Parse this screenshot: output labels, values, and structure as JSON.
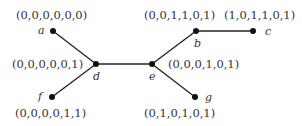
{
  "diagram": {
    "type": "tree",
    "nodes": [
      {
        "id": "a",
        "label": "a",
        "vector": "(0,0,0,0,0,0)",
        "x": 53,
        "y": 31
      },
      {
        "id": "b",
        "label": "b",
        "vector": "(0,0,1,1,0,1)",
        "x": 196,
        "y": 31
      },
      {
        "id": "c",
        "label": "c",
        "vector": "(1,0,1,1,0,1)",
        "x": 253,
        "y": 31
      },
      {
        "id": "d",
        "label": "d",
        "vector": "(0,0,0,0,0,1)",
        "x": 96,
        "y": 64
      },
      {
        "id": "e",
        "label": "e",
        "vector": "(0,0,0,1,0,1)",
        "x": 152,
        "y": 64
      },
      {
        "id": "f",
        "label": "f",
        "vector": "(0,0,0,0,1,1)",
        "x": 52,
        "y": 97
      },
      {
        "id": "g",
        "label": "g",
        "vector": "(0,1,0,1,0,1)",
        "x": 195,
        "y": 97
      }
    ],
    "edges": [
      [
        "a",
        "d"
      ],
      [
        "f",
        "d"
      ],
      [
        "d",
        "e"
      ],
      [
        "e",
        "b"
      ],
      [
        "b",
        "c"
      ],
      [
        "e",
        "g"
      ]
    ]
  }
}
